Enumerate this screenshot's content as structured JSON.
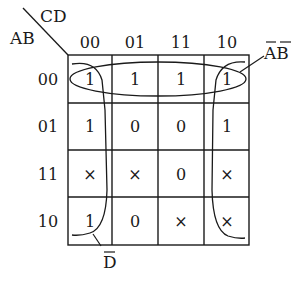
{
  "diagram": {
    "type": "karnaugh-map",
    "corner": {
      "col_var": "CD",
      "row_var": "AB"
    },
    "col_headers": [
      "00",
      "01",
      "11",
      "10"
    ],
    "row_headers": [
      "00",
      "01",
      "11",
      "10"
    ],
    "cells": [
      [
        "1",
        "1",
        "1",
        "1"
      ],
      [
        "1",
        "0",
        "0",
        "1"
      ],
      [
        "×",
        "×",
        "0",
        "×"
      ],
      [
        "1",
        "0",
        "×",
        "×"
      ]
    ],
    "groups": [
      {
        "label": "A̅B̅",
        "label_main": "AB",
        "shape": "ellipse",
        "covers": "row 00"
      },
      {
        "label": "D̅",
        "label_main": "D",
        "shape": "wrap-around columns 00 and 10",
        "covers": "columns CD=00 and CD=10"
      }
    ],
    "colors": {
      "ink": "#1a1a1a",
      "background": "#ffffff"
    }
  }
}
